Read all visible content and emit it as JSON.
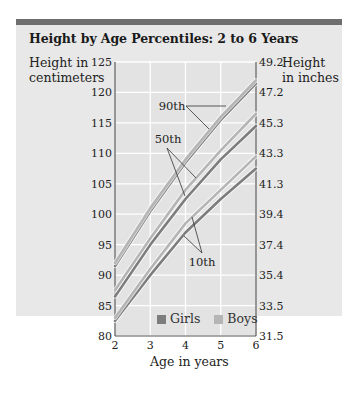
{
  "title": "Height by Age Percentiles: 2 to 6 Years",
  "axes": {
    "y_left_label_line1": "Height in",
    "y_left_label_line2": "centimeters",
    "y_right_label_line1": "Height",
    "y_right_label_line2": "in inches",
    "x_label": "Age in years"
  },
  "legend": {
    "girls": "Girls",
    "boys": "Boys",
    "girls_color": "#7d7d7d",
    "boys_color": "#b5b5b5"
  },
  "annotations": {
    "p90": "90th",
    "p50": "50th",
    "p10": "10th"
  },
  "chart_data": {
    "type": "line",
    "title": "Height by Age Percentiles: 2 to 6 Years",
    "xlabel": "Age in years",
    "ylabel": "Height in centimeters",
    "ylabel_right": "Height in inches",
    "x": [
      2,
      3,
      4,
      5,
      6
    ],
    "xlim": [
      2,
      6
    ],
    "ylim": [
      80,
      125
    ],
    "x_ticks": [
      "2",
      "3",
      "4",
      "5",
      "6"
    ],
    "y_ticks_left": [
      "80",
      "85",
      "90",
      "95",
      "100",
      "105",
      "110",
      "115",
      "120",
      "125"
    ],
    "y_ticks_right": [
      "31.5",
      "33.5",
      "35.4",
      "37.4",
      "39.4",
      "41.3",
      "43.3",
      "45.3",
      "47.2",
      "49.2"
    ],
    "grid": true,
    "legend_position": "bottom-right inside",
    "series": [
      {
        "name": "Girls 90th",
        "group": "Girls",
        "percentile": "90th",
        "values": [
          91.5,
          100.5,
          108.5,
          115.5,
          121.5
        ]
      },
      {
        "name": "Boys 90th",
        "group": "Boys",
        "percentile": "90th",
        "values": [
          92.0,
          101.0,
          109.0,
          116.0,
          122.0
        ]
      },
      {
        "name": "Girls 50th",
        "group": "Girls",
        "percentile": "50th",
        "values": [
          86.5,
          95.0,
          102.5,
          109.0,
          114.5
        ]
      },
      {
        "name": "Boys 50th",
        "group": "Boys",
        "percentile": "50th",
        "values": [
          87.5,
          96.0,
          104.0,
          110.5,
          116.5
        ]
      },
      {
        "name": "Girls 10th",
        "group": "Girls",
        "percentile": "10th",
        "values": [
          82.5,
          90.0,
          97.0,
          102.5,
          107.5
        ]
      },
      {
        "name": "Boys 10th",
        "group": "Boys",
        "percentile": "10th",
        "values": [
          83.0,
          91.0,
          98.5,
          104.0,
          109.5
        ]
      }
    ]
  }
}
